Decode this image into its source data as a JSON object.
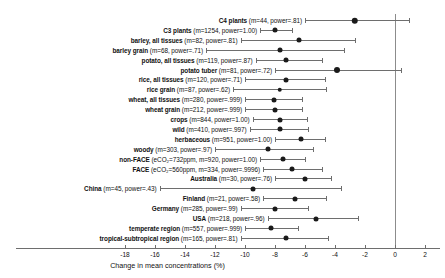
{
  "chart_data": {
    "type": "scatter",
    "subtype": "forest-plot",
    "title": "",
    "xlabel": "Change in mean concentrations (%)",
    "ylabel": "",
    "xlim": [
      -19.5,
      3.0
    ],
    "xticks": [
      -18,
      -16,
      -14,
      -12,
      -10,
      -8,
      -6,
      -4,
      -2,
      0,
      2
    ],
    "xticklabels": [
      "-18",
      "-16",
      "-14",
      "-12",
      "-10",
      "-8",
      "-6",
      "-4",
      "-2",
      "0",
      "2"
    ],
    "grid": false,
    "reference_line": 0,
    "legend": "none",
    "marker_color": "#1a1a1a",
    "ci_color": "#6e6e6e",
    "categories": [
      "C4 plants",
      "C3 plants",
      "barley, all tissues",
      "barley grain",
      "potato, all tissues",
      "potato tuber",
      "rice, all tissues",
      "rice grain",
      "wheat, all tissues",
      "wheat grain",
      "crops",
      "wild",
      "herbaceous",
      "woody",
      "non-FACE",
      "FACE",
      "Australia",
      "China",
      "Finland",
      "Germany",
      "USA",
      "temperate region",
      "tropical-subtropical region"
    ],
    "values": [
      -2.7,
      -8.0,
      -6.4,
      -7.7,
      -7.3,
      -3.9,
      -7.3,
      -7.7,
      -8.1,
      -8.0,
      -7.7,
      -7.7,
      -6.3,
      -8.5,
      -7.5,
      -6.9,
      -6.0,
      -9.5,
      -6.7,
      -8.0,
      -5.3,
      -8.3,
      -7.3
    ],
    "ci_low": [
      -6.0,
      -9.0,
      -10.3,
      -12.6,
      -9.3,
      -8.0,
      -10.0,
      -10.8,
      -10.0,
      -10.0,
      -9.5,
      -9.7,
      -8.0,
      -12.0,
      -9.0,
      -8.8,
      -8.0,
      -15.7,
      -8.8,
      -10.3,
      -8.5,
      -10.0,
      -10.3
    ],
    "ci_high": [
      0.9,
      -6.9,
      -2.7,
      -3.4,
      -4.9,
      0.4,
      -4.7,
      -4.6,
      -6.2,
      -6.2,
      -5.9,
      -5.8,
      -4.7,
      -5.5,
      -6.0,
      -4.9,
      -4.3,
      -3.6,
      -4.6,
      -5.8,
      -2.5,
      -6.5,
      -4.5
    ],
    "series_note": "Point estimates with 95% confidence intervals; marker size scales with sample size"
  },
  "rows": [
    {
      "name": "C4 plants",
      "stats": " (m=44, power=.81)",
      "m": 44,
      "power": ".81",
      "value": -2.7,
      "ci_low": -6.0,
      "ci_high": 0.9,
      "dot": 6.5
    },
    {
      "name": "C3 plants",
      "stats": " (m=1254, power=1.00)",
      "m": 1254,
      "power": "1.00",
      "value": -8.0,
      "ci_low": -9.0,
      "ci_high": -6.9,
      "dot": 5.0
    },
    {
      "name": "barley, all tissues",
      "stats": " (m=82, power=.81)",
      "m": 82,
      "power": ".81",
      "value": -6.4,
      "ci_low": -10.3,
      "ci_high": -2.7,
      "dot": 5.0
    },
    {
      "name": "barley grain",
      "stats": " (m=68, power=.71)",
      "m": 68,
      "power": ".71",
      "value": -7.7,
      "ci_low": -12.6,
      "ci_high": -3.4,
      "dot": 5.0
    },
    {
      "name": "potato, all tissues",
      "stats": " (m=119, power=.87)",
      "m": 119,
      "power": ".87",
      "value": -7.3,
      "ci_low": -9.3,
      "ci_high": -4.9,
      "dot": 5.0
    },
    {
      "name": "potato tuber",
      "stats": " (m=81, power=.72)",
      "m": 81,
      "power": ".72",
      "value": -3.9,
      "ci_low": -8.0,
      "ci_high": 0.4,
      "dot": 6.0
    },
    {
      "name": "rice, all tissues",
      "stats": " (m=120, power=.71)",
      "m": 120,
      "power": ".71",
      "value": -7.3,
      "ci_low": -10.0,
      "ci_high": -4.7,
      "dot": 5.0
    },
    {
      "name": "rice grain",
      "stats": " (m=87, power=.62)",
      "m": 87,
      "power": ".62",
      "value": -7.7,
      "ci_low": -10.8,
      "ci_high": -4.6,
      "dot": 4.5
    },
    {
      "name": "wheat, all tissues",
      "stats": " (m=280, power=.999)",
      "m": 280,
      "power": ".999",
      "value": -8.1,
      "ci_low": -10.0,
      "ci_high": -6.2,
      "dot": 5.0
    },
    {
      "name": "wheat grain",
      "stats": " (m=212, power=.999)",
      "m": 212,
      "power": ".999",
      "value": -8.0,
      "ci_low": -10.0,
      "ci_high": -6.2,
      "dot": 5.0
    },
    {
      "name": "crops",
      "stats": " (m=844, power=1.00)",
      "m": 844,
      "power": "1.00",
      "value": -7.7,
      "ci_low": -9.5,
      "ci_high": -5.9,
      "dot": 5.0
    },
    {
      "name": "wild",
      "stats": " (m=410, power=.997)",
      "m": 410,
      "power": ".997",
      "value": -7.7,
      "ci_low": -9.7,
      "ci_high": -5.8,
      "dot": 5.0
    },
    {
      "name": "herbaceous",
      "stats": " (m=951, power=1.00)",
      "m": 951,
      "power": "1.00",
      "value": -6.3,
      "ci_low": -8.0,
      "ci_high": -4.7,
      "dot": 5.0
    },
    {
      "name": "woody",
      "stats": " (m=303, power=.97)",
      "m": 303,
      "power": ".97",
      "value": -8.5,
      "ci_low": -12.0,
      "ci_high": -5.5,
      "dot": 5.0
    },
    {
      "name": "non-FACE",
      "stats": " (eCO₂=732ppm, m=920, power=1.00)",
      "m": 920,
      "power": "1.00",
      "value": -7.5,
      "ci_low": -9.0,
      "ci_high": -6.0,
      "dot": 5.0
    },
    {
      "name": "FACE",
      "stats": " (eCO₂=560ppm, m=334, power=.9996)",
      "m": 334,
      "power": ".9996",
      "value": -6.9,
      "ci_low": -8.8,
      "ci_high": -4.9,
      "dot": 5.0
    },
    {
      "name": "Australia",
      "stats": " (m=30, power=.76)",
      "m": 30,
      "power": ".76",
      "value": -6.0,
      "ci_low": -8.0,
      "ci_high": -4.3,
      "dot": 5.0
    },
    {
      "name": "China",
      "stats": " (m=45, power=.43)",
      "m": 45,
      "power": ".43",
      "value": -9.5,
      "ci_low": -15.7,
      "ci_high": -3.6,
      "dot": 5.0
    },
    {
      "name": "Finland",
      "stats": " (m=21, power=.58)",
      "m": 21,
      "power": ".58",
      "value": -6.7,
      "ci_low": -8.8,
      "ci_high": -4.6,
      "dot": 5.0
    },
    {
      "name": "Germany",
      "stats": " (m=285, power=.99)",
      "m": 285,
      "power": ".99",
      "value": -8.0,
      "ci_low": -10.3,
      "ci_high": -5.8,
      "dot": 5.0
    },
    {
      "name": "USA",
      "stats": " (m=218, power=.96)",
      "m": 218,
      "power": ".96",
      "value": -5.3,
      "ci_low": -8.5,
      "ci_high": -2.5,
      "dot": 5.0
    },
    {
      "name": "temperate region",
      "stats": " (m=557, power=.999)",
      "m": 557,
      "power": ".999",
      "value": -8.3,
      "ci_low": -10.0,
      "ci_high": -6.5,
      "dot": 5.0
    },
    {
      "name": "tropical-subtropical region",
      "stats": " (m=165, power=.81)",
      "m": 165,
      "power": ".81",
      "value": -7.3,
      "ci_low": -10.3,
      "ci_high": -4.5,
      "dot": 5.0
    }
  ],
  "axis": {
    "label": "Change in mean concentrations (%)",
    "ticks": [
      "-18",
      "-16",
      "-14",
      "-12",
      "-10",
      "-8",
      "-6",
      "-4",
      "-2",
      "0",
      "2"
    ]
  }
}
